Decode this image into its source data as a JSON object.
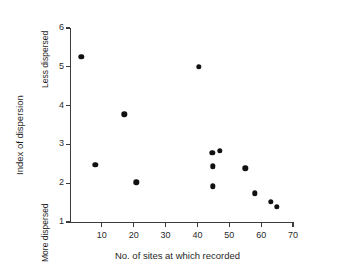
{
  "chart_data": {
    "type": "scatter",
    "title": "",
    "xlabel": "No. of sites at which recorded",
    "ylabel": "Index of dispersion",
    "xlim": [
      0,
      70
    ],
    "ylim": [
      1,
      6
    ],
    "grid": false,
    "legend": null,
    "xticks": [
      10,
      20,
      30,
      40,
      50,
      60,
      70
    ],
    "yticks": [
      1,
      2,
      3,
      4,
      5,
      6
    ],
    "xtick_labels": [
      "10",
      "20",
      "30",
      "40",
      "50",
      "60",
      "70"
    ],
    "ytick_labels": [
      "1",
      "2",
      "3",
      "4",
      "5",
      "6"
    ],
    "annotations": [
      {
        "name": "less-dispersed",
        "text": "Less dispersed",
        "axis": "y",
        "position": "upper"
      },
      {
        "name": "more-dispersed",
        "text": "More dispersed",
        "axis": "y",
        "position": "lower"
      }
    ],
    "marker": {
      "shape": "circle",
      "color": "#111111",
      "size": 5.4
    },
    "points": [
      {
        "x": 3.5,
        "y": 5.25
      },
      {
        "x": 8.0,
        "y": 2.47
      },
      {
        "x": 17.0,
        "y": 3.78
      },
      {
        "x": 20.8,
        "y": 2.02
      },
      {
        "x": 40.5,
        "y": 5.0
      },
      {
        "x": 44.7,
        "y": 2.78
      },
      {
        "x": 47.0,
        "y": 2.83
      },
      {
        "x": 44.8,
        "y": 2.44
      },
      {
        "x": 44.8,
        "y": 1.92
      },
      {
        "x": 55.0,
        "y": 2.38
      },
      {
        "x": 58.0,
        "y": 1.74
      },
      {
        "x": 63.0,
        "y": 1.52
      },
      {
        "x": 65.0,
        "y": 1.39
      }
    ],
    "series": [
      {
        "name": "dispersion",
        "x": [
          3.5,
          8.0,
          17.0,
          20.8,
          40.5,
          44.7,
          47.0,
          44.8,
          44.8,
          55.0,
          58.0,
          63.0,
          65.0
        ],
        "values": [
          5.25,
          2.47,
          3.78,
          2.02,
          5.0,
          2.78,
          2.83,
          2.44,
          1.92,
          2.38,
          1.74,
          1.52,
          1.39
        ]
      }
    ]
  }
}
